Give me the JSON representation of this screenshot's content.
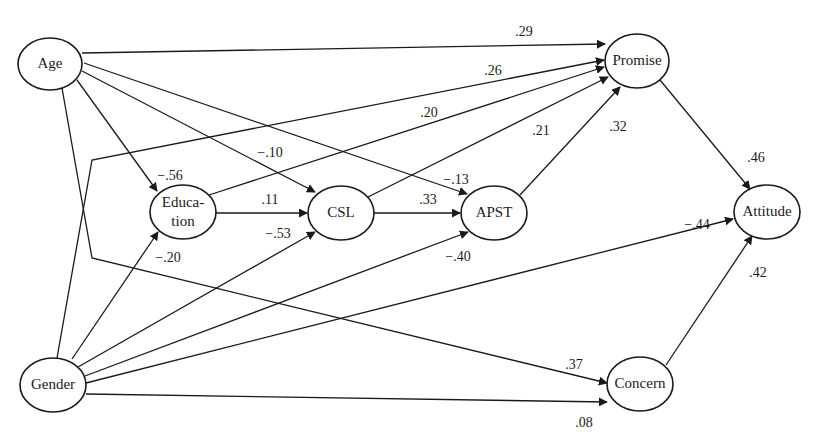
{
  "diagram": {
    "type": "path-diagram",
    "nodes": [
      {
        "id": "age",
        "label": "Age",
        "cx": 50,
        "cy": 64,
        "rx": 32,
        "ry": 26
      },
      {
        "id": "gender",
        "label": "Gender",
        "cx": 53,
        "cy": 385,
        "rx": 33,
        "ry": 27
      },
      {
        "id": "education",
        "label_lines": [
          "Educa-",
          "tion"
        ],
        "label": "Education",
        "cx": 183,
        "cy": 212,
        "rx": 33,
        "ry": 27
      },
      {
        "id": "csl",
        "label": "CSL",
        "cx": 341,
        "cy": 213,
        "rx": 33,
        "ry": 27
      },
      {
        "id": "apst",
        "label": "APST",
        "cx": 494,
        "cy": 213,
        "rx": 33,
        "ry": 27
      },
      {
        "id": "promise",
        "label": "Promise",
        "cx": 637,
        "cy": 61,
        "rx": 32,
        "ry": 27
      },
      {
        "id": "attitude",
        "label": "Attitude",
        "cx": 767,
        "cy": 212,
        "rx": 33,
        "ry": 27
      },
      {
        "id": "concern",
        "label": "Concern",
        "cx": 640,
        "cy": 384,
        "rx": 33,
        "ry": 27
      }
    ],
    "edges": [
      {
        "from": "age",
        "to": "promise",
        "coef": ".29",
        "points": [
          [
            82,
            53
          ],
          [
            605,
            44
          ]
        ],
        "lx": 524,
        "ly": 33
      },
      {
        "from": "gender",
        "to": "promise",
        "coef": ".26",
        "points": [
          [
            57,
            358
          ],
          [
            92,
            160
          ],
          [
            604,
            60
          ]
        ],
        "lx": 493,
        "ly": 72
      },
      {
        "from": "education",
        "to": "promise",
        "coef": ".20",
        "points": [
          [
            209,
            195
          ],
          [
            604,
            67
          ]
        ],
        "lx": 429,
        "ly": 114
      },
      {
        "from": "csl",
        "to": "promise",
        "coef": ".21",
        "points": [
          [
            368,
            197
          ],
          [
            608,
            77
          ]
        ],
        "lx": 541,
        "ly": 132
      },
      {
        "from": "apst",
        "to": "promise",
        "coef": ".32",
        "points": [
          [
            520,
            195
          ],
          [
            620,
            87
          ]
        ],
        "lx": 618,
        "ly": 128
      },
      {
        "from": "age",
        "to": "education",
        "coef": "−.56",
        "points": [
          [
            77,
            80
          ],
          [
            157,
            191
          ]
        ],
        "lx": 170,
        "ly": 177
      },
      {
        "from": "age",
        "to": "csl",
        "coef": "−.10",
        "points": [
          [
            82,
            71
          ],
          [
            315,
            192
          ]
        ],
        "lx": 270,
        "ly": 154
      },
      {
        "from": "age",
        "to": "apst",
        "coef": "−.13",
        "points": [
          [
            84,
            63
          ],
          [
            467,
            194
          ]
        ],
        "lx": 456,
        "ly": 181
      },
      {
        "from": "education",
        "to": "csl",
        "coef": ".11",
        "points": [
          [
            216,
            213
          ],
          [
            307,
            213
          ]
        ],
        "lx": 270,
        "ly": 201
      },
      {
        "from": "csl",
        "to": "apst",
        "coef": ".33",
        "points": [
          [
            374,
            213
          ],
          [
            460,
            213
          ]
        ],
        "lx": 428,
        "ly": 201
      },
      {
        "from": "gender",
        "to": "education",
        "coef": "−.20",
        "points": [
          [
            72,
            359
          ],
          [
            158,
            232
          ]
        ],
        "lx": 168,
        "ly": 259
      },
      {
        "from": "gender",
        "to": "csl",
        "coef": "−.53",
        "points": [
          [
            78,
            367
          ],
          [
            315,
            232
          ]
        ],
        "lx": 278,
        "ly": 235
      },
      {
        "from": "gender",
        "to": "apst",
        "coef": "−.40",
        "points": [
          [
            85,
            376
          ],
          [
            468,
            232
          ]
        ],
        "lx": 458,
        "ly": 258
      },
      {
        "from": "gender",
        "to": "attitude",
        "coef": "−.44",
        "points": [
          [
            86,
            383
          ],
          [
            733,
            219
          ]
        ],
        "lx": 697,
        "ly": 226
      },
      {
        "from": "age",
        "to": "concern",
        "coef": ".37",
        "points": [
          [
            62,
            88
          ],
          [
            92,
            258
          ],
          [
            607,
            383
          ]
        ],
        "lx": 574,
        "ly": 366
      },
      {
        "from": "gender",
        "to": "concern",
        "coef": ".08",
        "points": [
          [
            86,
            394
          ],
          [
            607,
            402
          ]
        ],
        "lx": 584,
        "ly": 424
      },
      {
        "from": "promise",
        "to": "attitude",
        "coef": ".46",
        "points": [
          [
            660,
            80
          ],
          [
            750,
            189
          ]
        ],
        "lx": 756,
        "ly": 159
      },
      {
        "from": "concern",
        "to": "attitude",
        "coef": ".42",
        "points": [
          [
            666,
            365
          ],
          [
            752,
            236
          ]
        ],
        "lx": 758,
        "ly": 274
      }
    ]
  }
}
